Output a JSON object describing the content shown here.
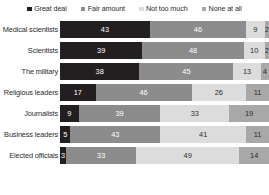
{
  "chart_data": {
    "type": "bar",
    "subtype": "stacked-horizontal-100",
    "title": "",
    "subtitle": "",
    "xlabel": "",
    "ylabel": "",
    "xlim": [
      0,
      100
    ],
    "grid": false,
    "legend_position": "top",
    "categories": [
      "Medical scientists",
      "Scientists",
      "The military",
      "Religious leaders",
      "Journalists",
      "Business leaders",
      "Elected officials"
    ],
    "series": [
      {
        "name": "Great deal",
        "color": "#231f20",
        "values": [
          43,
          39,
          38,
          17,
          9,
          5,
          3
        ]
      },
      {
        "name": "Fair amount",
        "color": "#8c8c8c",
        "values": [
          46,
          48,
          45,
          46,
          39,
          43,
          33
        ]
      },
      {
        "name": "Not too much",
        "color": "#dcdcdc",
        "values": [
          9,
          10,
          13,
          26,
          33,
          41,
          49
        ]
      },
      {
        "name": "None at all",
        "color": "#a8a8a8",
        "values": [
          2,
          2,
          4,
          11,
          19,
          11,
          14
        ]
      }
    ]
  },
  "legend": {
    "items": [
      {
        "label": "Great deal",
        "swatch_class": "sw-great"
      },
      {
        "label": "Fair amount",
        "swatch_class": "sw-fair"
      },
      {
        "label": "Not too much",
        "swatch_class": "sw-nottoo"
      },
      {
        "label": "None at all",
        "swatch_class": "sw-none"
      }
    ]
  },
  "rows": [
    {
      "label": "Medical scientists",
      "values": [
        43,
        46,
        9,
        2
      ]
    },
    {
      "label": "Scientists",
      "values": [
        39,
        48,
        10,
        2
      ]
    },
    {
      "label": "The military",
      "values": [
        38,
        45,
        13,
        4
      ]
    },
    {
      "label": "Religious leaders",
      "values": [
        17,
        46,
        26,
        11
      ]
    },
    {
      "label": "Journalists",
      "values": [
        9,
        39,
        33,
        19
      ]
    },
    {
      "label": "Business leaders",
      "values": [
        5,
        43,
        41,
        11
      ]
    },
    {
      "label": "Elected officials",
      "values": [
        3,
        33,
        49,
        14
      ]
    }
  ]
}
